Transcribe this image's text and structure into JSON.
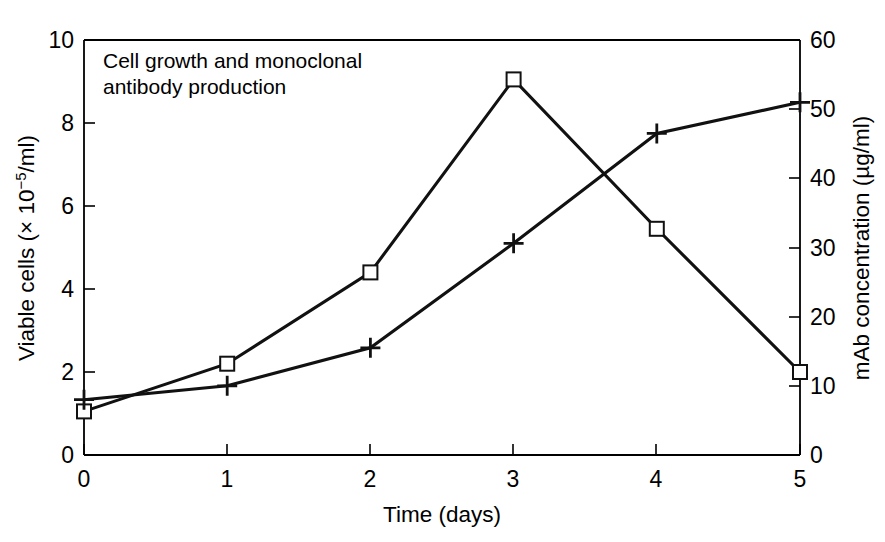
{
  "chart_data": {
    "type": "line",
    "title": "Cell growth and monoclonal antibody production",
    "title_line1": "Cell growth and monoclonal",
    "title_line2": "antibody production",
    "xlabel": "Time (days)",
    "ylabel": "Viable cells (× 10−5/ml)",
    "ylabel_prefix": "Viable cells (× 10",
    "ylabel_exponent": "−5",
    "ylabel_suffix": "/ml)",
    "y2label": "mAb concentration (µg/ml)",
    "x": [
      0,
      1,
      2,
      3,
      4,
      5
    ],
    "xlim": [
      0,
      5
    ],
    "ylim": [
      0,
      10
    ],
    "y2lim": [
      0,
      60
    ],
    "xticks": [
      "0",
      "1",
      "2",
      "3",
      "4",
      "5"
    ],
    "yticks": [
      "0",
      "2",
      "4",
      "6",
      "8",
      "10"
    ],
    "y2ticks": [
      "0",
      "10",
      "20",
      "30",
      "40",
      "50",
      "60"
    ],
    "ytick_values": [
      0,
      2,
      4,
      6,
      8,
      10
    ],
    "y2tick_values": [
      0,
      10,
      20,
      30,
      40,
      50,
      60
    ],
    "grid": false,
    "legend": "none",
    "series": [
      {
        "name": "Viable cells",
        "marker": "square",
        "axis": "left",
        "values": [
          1.05,
          2.2,
          4.4,
          9.05,
          5.45,
          2.0
        ]
      },
      {
        "name": "mAb concentration",
        "marker": "plus",
        "axis": "right",
        "values": [
          8.0,
          10.0,
          15.5,
          30.6,
          46.5,
          51.0
        ]
      }
    ],
    "colors": {
      "line": "#111111",
      "axis": "#000000",
      "background": "#ffffff",
      "marker_fill": "#ffffff"
    }
  }
}
